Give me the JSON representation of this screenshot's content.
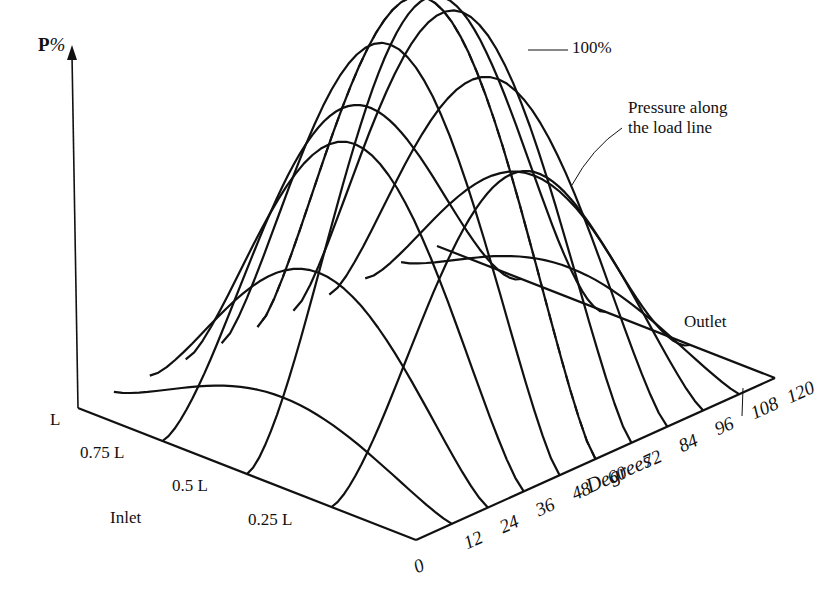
{
  "diagram": {
    "axis_label_bold": "P",
    "axis_label_suffix": "%",
    "peak_label": "100%",
    "annotation_line1": "Pressure along",
    "annotation_line2": "the load line",
    "outlet_label": "Outlet",
    "inlet_label": "Inlet",
    "degrees_label": "Degrees",
    "length_ticks": [
      {
        "label": "L",
        "x": 50,
        "y": 410
      },
      {
        "label": "0.75 L",
        "x": 80,
        "y": 443
      },
      {
        "label": "0.5 L",
        "x": 172,
        "y": 476
      },
      {
        "label": "Inlet",
        "x": 110,
        "y": 508
      },
      {
        "label": "0.25 L",
        "x": 248,
        "y": 510
      }
    ],
    "degree_ticks": [
      "0",
      "12",
      "24",
      "36",
      "48",
      "60",
      "72",
      "84",
      "96",
      "108",
      "120"
    ],
    "line_color": "#111111",
    "background": "#ffffff"
  },
  "chart_data": {
    "type": "surface-wireframe",
    "title": "",
    "zlabel": "P %",
    "xlabel": "Degrees",
    "ylabel": "Bearing length (Inlet to Outlet)",
    "x_ticks": [
      0,
      12,
      24,
      36,
      48,
      60,
      72,
      84,
      96,
      108,
      120
    ],
    "y_ticks": [
      "0",
      "0.25 L",
      "0.5 L",
      "0.75 L",
      "L"
    ],
    "peak": {
      "value": 100,
      "unit": "%",
      "degree": 60,
      "length": "0.5 L"
    },
    "annotations": [
      "100%",
      "Pressure along the load line",
      "Inlet",
      "Outlet"
    ],
    "load_line_degree": 60,
    "load_line_style": "dashed"
  }
}
